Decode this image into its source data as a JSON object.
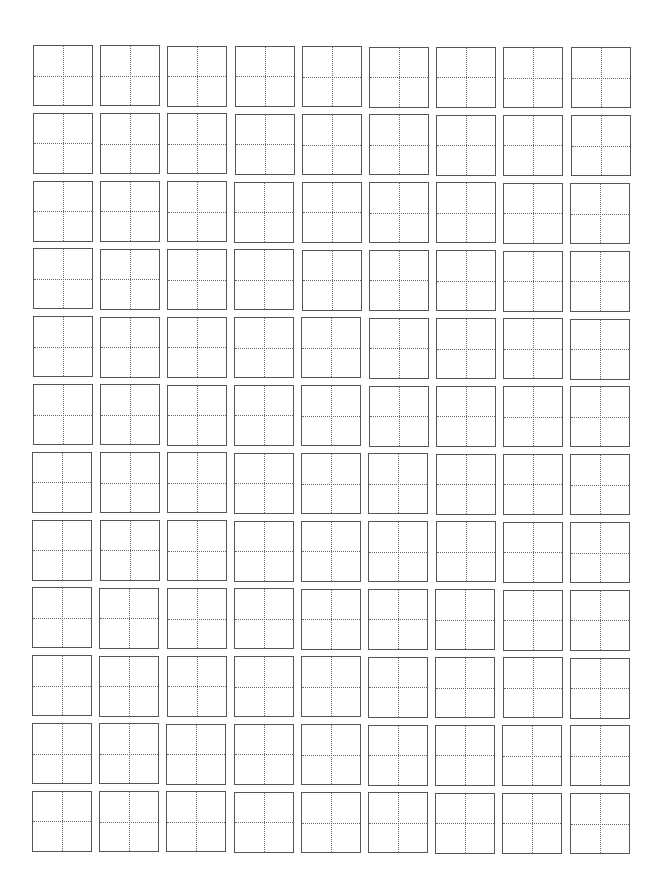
{
  "page": {
    "type": "tian-zi-ge practice sheet",
    "rows": 12,
    "columns": 9,
    "cell_width": 60,
    "cell_height": 61,
    "origin_x": 33,
    "origin_y": 45,
    "column_pitch": 67.2,
    "row_pitch": 67.8,
    "border_color": "#555555",
    "guide_color": "#6a6a6a",
    "guide_style": "dotted cross"
  }
}
